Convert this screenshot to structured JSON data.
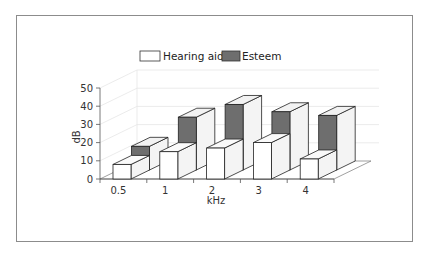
{
  "chart_data": {
    "type": "bar",
    "subtype": "3d-grouped-depth",
    "title": "",
    "xlabel": "kHz",
    "ylabel": "dB",
    "categories": [
      "0.5",
      "1",
      "2",
      "3",
      "4"
    ],
    "series": [
      {
        "name": "Hearing aid",
        "values": [
          8,
          15,
          17,
          20,
          11
        ],
        "color": "#ffffff",
        "row": "front"
      },
      {
        "name": "Esteem",
        "values": [
          13,
          29,
          36,
          32,
          30
        ],
        "color": "#6e6e6e",
        "row": "back"
      }
    ],
    "ylim": [
      0,
      50
    ],
    "yticks": [
      "0",
      "10",
      "20",
      "30",
      "40",
      "50"
    ],
    "grid": true,
    "legend_position": "top"
  },
  "legend": {
    "items": [
      {
        "label": "Hearing aid",
        "color": "#ffffff"
      },
      {
        "label": "Esteem",
        "color": "#6e6e6e"
      }
    ]
  },
  "axes": {
    "x_title": "kHz",
    "y_title": "dB"
  }
}
